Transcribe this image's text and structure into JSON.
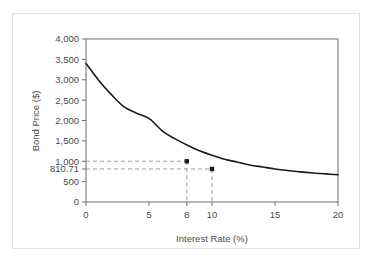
{
  "chart_data": {
    "type": "line",
    "title": "",
    "xlabel": "Interest Rate (%)",
    "ylabel": "Bond Price ($)",
    "xlim": [
      0,
      20
    ],
    "ylim": [
      0,
      4000
    ],
    "grid": false,
    "legend": "none",
    "xticks": [
      0,
      5,
      8,
      10,
      15,
      20
    ],
    "xtick_labels": [
      "0",
      "5",
      "8",
      "10",
      "15",
      "20"
    ],
    "yticks": [
      0,
      500,
      810.71,
      1000,
      1500,
      2000,
      2500,
      3000,
      3500,
      4000
    ],
    "ytick_labels": [
      "0",
      "500",
      "810.71",
      "1,000",
      "1,500",
      "2,000",
      "2,500",
      "3,000",
      "3,500",
      "4,000"
    ],
    "series": [
      {
        "name": "Bond Price",
        "color": "#1a1a1a",
        "x": [
          0,
          1,
          2,
          3,
          4,
          5,
          6,
          7,
          8,
          9,
          10,
          11,
          12,
          13,
          14,
          15,
          16,
          17,
          18,
          19,
          20
        ],
        "values": [
          3400,
          2990,
          2640,
          2340,
          2180,
          2050,
          1760,
          1560,
          1400,
          1260,
          1150,
          1050,
          980,
          910,
          860,
          810,
          775,
          740,
          712,
          690,
          670
        ]
      }
    ],
    "annotations": [
      {
        "name": "par-point",
        "x": 8,
        "y": 1000,
        "label": "1,000",
        "marker": "square",
        "guides": [
          "horizontal",
          "vertical"
        ]
      },
      {
        "name": "discount-point",
        "x": 10,
        "y": 810.71,
        "label": "810.71",
        "marker": "square",
        "guides": [
          "horizontal",
          "vertical"
        ]
      }
    ],
    "colors": {
      "curve": "#1a1a1a",
      "axis": "#6e6e6e",
      "guide": "#9a9a9a",
      "text": "#4c4c4c",
      "card_border": "#e2e2e2",
      "background": "#ffffff"
    }
  }
}
